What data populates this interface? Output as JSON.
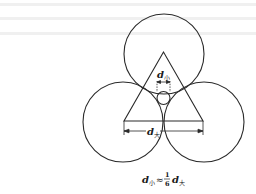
{
  "diagram": {
    "labels": {
      "d_small": {
        "symbol": "d",
        "subscript": "小"
      },
      "d_large": {
        "symbol": "d",
        "subscript": "大"
      }
    },
    "formula": {
      "lhs_symbol": "d",
      "lhs_subscript": "小",
      "relation": "≈",
      "fraction_numerator": "1",
      "fraction_denominator": "6",
      "rhs_symbol": "d",
      "rhs_subscript": "大"
    },
    "colors": {
      "stroke": "#2a2a2a",
      "background": "#ffffff",
      "bleed_text": "#ececec"
    }
  }
}
